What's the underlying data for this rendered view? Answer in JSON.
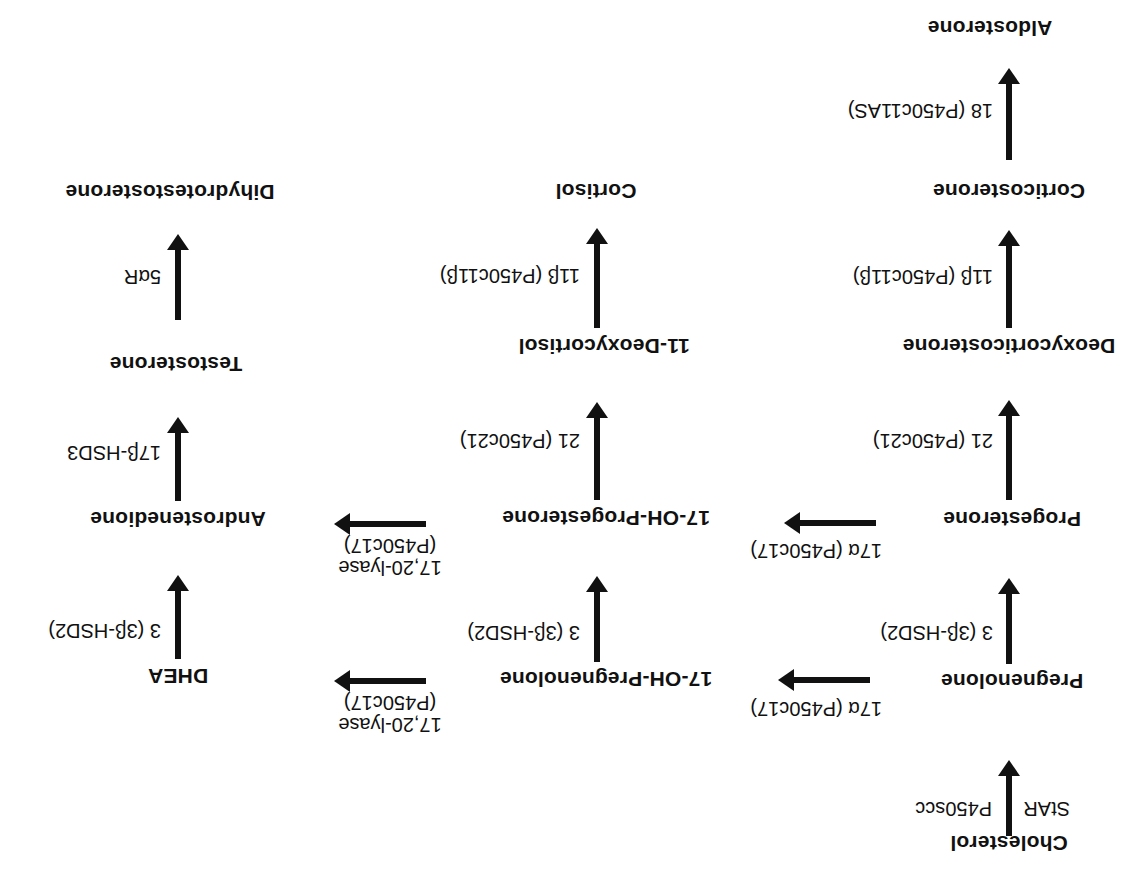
{
  "orientation": "rotated-180",
  "columns": {
    "mineralocorticoid": [
      "Cholesterol",
      "Pregnenolone",
      "Progesterone",
      "Deoxycorticosterone",
      "Corticosterone",
      "Aldosterone"
    ],
    "glucocorticoid": [
      "17-OH-Pregnenolone",
      "17-OH-Progesterone",
      "11-Deoxycortisol",
      "Cortisol"
    ],
    "androgen": [
      "DHEA",
      "Androstenedione",
      "Testosterone",
      "Dihydrotestosterone"
    ]
  },
  "nodes": {
    "cholesterol": "Cholesterol",
    "pregnenolone": "Pregnenolone",
    "progesterone": "Progesterone",
    "deoxycorticosterone": "Deoxycorticosterone",
    "corticosterone": "Corticosterone",
    "aldosterone": "Aldosterone",
    "oh_pregnenolone": "17-OH-Pregnenolone",
    "oh_progesterone": "17-OH-Progesterone",
    "deoxycortisol": "11-Deoxycortisol",
    "cortisol": "Cortisol",
    "dhea": "DHEA",
    "androstenedione": "Androstenedione",
    "testosterone": "Testosterone",
    "dht": "Dihydrotestosterone"
  },
  "enzymes": {
    "star": "StAR",
    "p450scc": "P450scc",
    "preg_to_prog": "3 (3β-HSD2)",
    "prog_to_doc": "21 (P450c21)",
    "doc_to_cort": "11β (P450c11β)",
    "cort_to_aldo": "18 (P450c11AS)",
    "preg_to_ohpreg": "17α (P450c17)",
    "prog_to_ohprog": "17α (P450c17)",
    "ohpreg_to_ohprog": "3 (3β-HSD2)",
    "ohprog_to_deoxycortisol": "21 (P450c21)",
    "deoxycortisol_to_cortisol": "11β (P450c11β)",
    "ohpreg_to_dhea_line1": "17,20-lyase",
    "ohpreg_to_dhea_line2": "(P450c17)",
    "ohprog_to_andro_line1": "17,20-lyase",
    "ohprog_to_andro_line2": "(P450c17)",
    "dhea_to_andro": "3 (3β-HSD2)",
    "andro_to_testo": "17β-HSD3",
    "testo_to_dht": "5αR"
  }
}
